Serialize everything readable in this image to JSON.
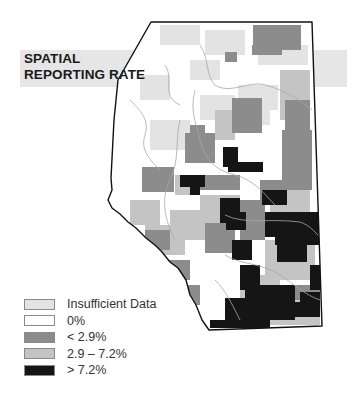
{
  "title": {
    "line1": "SPATIAL",
    "line2": "REPORTING RATE"
  },
  "map": {
    "region": "Alberta",
    "outline_color": "#111111",
    "river_color": "#a8a8a8"
  },
  "legend": {
    "items": [
      {
        "label": "Insufficient Data",
        "color": "#e3e3e3"
      },
      {
        "label": "0%",
        "color": "#ffffff"
      },
      {
        "label": "< 2.9%",
        "color": "#8c8c8c"
      },
      {
        "label": "2.9 – 7.2%",
        "color": "#c4c4c4"
      },
      {
        "label": "> 7.2%",
        "color": "#151515"
      }
    ]
  }
}
